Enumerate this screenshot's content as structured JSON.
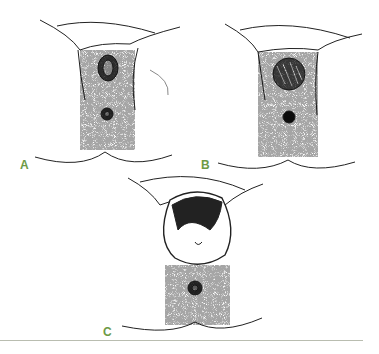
{
  "figure": {
    "panels": [
      {
        "id": "A",
        "label": "A",
        "description": "Perineal illustration with small lesion above anus"
      },
      {
        "id": "B",
        "label": "B",
        "description": "Perineal illustration with larger round hatched lesion above anus"
      },
      {
        "id": "C",
        "label": "C",
        "description": "Perineal illustration with large protruding mass above anus"
      }
    ],
    "label_color": "#6d9a45",
    "rule_color": "#b9bdb0"
  }
}
